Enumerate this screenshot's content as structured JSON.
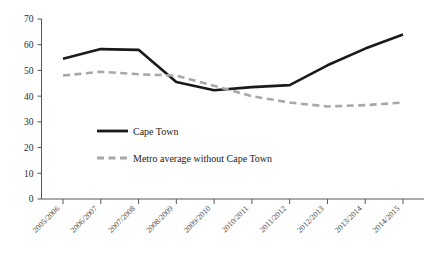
{
  "chart_data": {
    "type": "line",
    "title": "",
    "xlabel": "",
    "ylabel": "",
    "ylim": [
      0,
      70
    ],
    "yticks": [
      0,
      10,
      20,
      30,
      40,
      50,
      60,
      70
    ],
    "grid": false,
    "legend_position": "inside-center-left",
    "categories": [
      "2005/2006",
      "2006/2007",
      "2007/2008",
      "2008/2009",
      "2009/2010",
      "2010/2011",
      "2011/2012",
      "2012/2013",
      "2013/2014",
      "2014/2015"
    ],
    "series": [
      {
        "name": "Cape Town",
        "style": "solid",
        "color": "#1a1a1a",
        "values": [
          54.5,
          58.3,
          58.0,
          45.5,
          42.3,
          43.5,
          44.3,
          52.0,
          58.5,
          64.0
        ]
      },
      {
        "name": "Metro average without Cape Town",
        "style": "dashed",
        "color": "#a8a8a8",
        "values": [
          48.0,
          49.5,
          48.5,
          48.0,
          44.0,
          40.0,
          37.5,
          36.0,
          36.5,
          37.5
        ]
      }
    ]
  },
  "legend": {
    "entries": [
      {
        "label": "Cape Town"
      },
      {
        "label": "Metro average without Cape Town"
      }
    ]
  },
  "axes": {
    "y_tick_labels": [
      "70",
      "60",
      "50",
      "40",
      "30",
      "20",
      "10",
      "0"
    ],
    "x_tick_labels": [
      "2005/2006",
      "2006/2007",
      "2007/2008",
      "2008/2009",
      "2009/2010",
      "2010/2011",
      "2011/2012",
      "2012/2013",
      "2013/2014",
      "2014/2015"
    ]
  }
}
